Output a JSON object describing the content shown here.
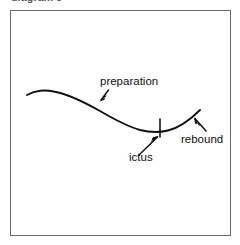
{
  "figure": {
    "caption_remnant": "diagram 5",
    "background_color": "#ffffff",
    "frame_color": "#6c6c6c",
    "stroke_color": "#111111"
  },
  "diagram": {
    "type": "annotated-curve",
    "curve_description": "A smooth wave rising slightly at the left, descending through the middle to a trough, then rebounding upward at the right.",
    "labels": [
      {
        "id": "preparation",
        "text": "preparation",
        "x": 100,
        "y": 75,
        "arrow_from": [
          108,
          91
        ],
        "arrow_to": [
          100,
          101
        ]
      },
      {
        "id": "ictus",
        "text": "ictus",
        "x": 129,
        "y": 151,
        "arrow_from": [
          140,
          154
        ],
        "arrow_to": [
          158,
          136
        ]
      },
      {
        "id": "rebound",
        "text": "rebound",
        "x": 181,
        "y": 133,
        "arrow_from": [
          206,
          131
        ],
        "arrow_to": [
          194,
          118
        ]
      }
    ],
    "tick_marks": [
      {
        "id": "ictus-tick",
        "x": 160,
        "y_top": 119,
        "y_bottom": 137
      }
    ]
  }
}
